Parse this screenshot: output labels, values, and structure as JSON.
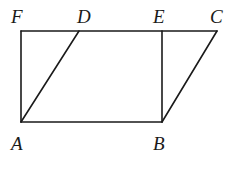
{
  "figure": {
    "type": "geometry",
    "points": {
      "F": {
        "label": "F",
        "x": 21,
        "y": 31
      },
      "D": {
        "label": "D",
        "x": 79,
        "y": 31
      },
      "E": {
        "label": "E",
        "x": 162,
        "y": 31
      },
      "C": {
        "label": "C",
        "x": 217,
        "y": 31
      },
      "A": {
        "label": "A",
        "x": 21,
        "y": 122
      },
      "B": {
        "label": "B",
        "x": 162,
        "y": 122
      }
    },
    "segments": [
      [
        "F",
        "C"
      ],
      [
        "F",
        "A"
      ],
      [
        "A",
        "B"
      ],
      [
        "E",
        "B"
      ],
      [
        "A",
        "D"
      ],
      [
        "B",
        "C"
      ]
    ],
    "colors": {
      "stroke": "#1a1a1a",
      "background": "#ffffff"
    }
  }
}
